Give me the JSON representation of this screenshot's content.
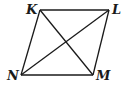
{
  "diagram": {
    "type": "parallelogram-with-diagonals",
    "stroke_color": "#1a1a1a",
    "vertices": [
      {
        "name": "K",
        "x": 40,
        "y": 10,
        "label_x": 26,
        "label_y": 3
      },
      {
        "name": "L",
        "x": 109,
        "y": 10,
        "label_x": 112,
        "label_y": 3
      },
      {
        "name": "M",
        "x": 93,
        "y": 75,
        "label_x": 96,
        "label_y": 69
      },
      {
        "name": "N",
        "x": 21,
        "y": 75,
        "label_x": 7,
        "label_y": 69
      }
    ],
    "sides": [
      [
        "K",
        "L"
      ],
      [
        "L",
        "M"
      ],
      [
        "M",
        "N"
      ],
      [
        "N",
        "K"
      ]
    ],
    "diagonals": [
      [
        "K",
        "M"
      ],
      [
        "N",
        "L"
      ]
    ]
  }
}
